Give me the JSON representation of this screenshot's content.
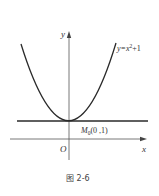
{
  "figure": {
    "caption": "图 2-6",
    "labels": {
      "y_axis": "y",
      "x_axis": "x",
      "origin": "O",
      "curve_prefix": "y=x",
      "curve_exp": "2",
      "curve_suffix": "+1",
      "point_name": "M",
      "point_sub": "0",
      "point_coords": "(0 ,1)"
    },
    "curve": {
      "equation": "y=x^2+1",
      "type": "parabola",
      "vertex": [
        0,
        1
      ]
    },
    "tangent_line": {
      "equation": "y=1",
      "through": "M0(0,1)"
    },
    "colors": {
      "stroke": "#2a2a2a",
      "text": "#333333"
    }
  }
}
